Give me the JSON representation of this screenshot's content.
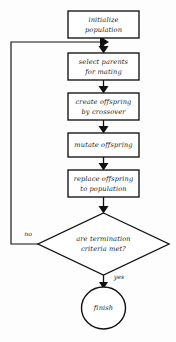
{
  "diagram": {
    "type": "flowchart",
    "nodes": [
      {
        "id": "initialize",
        "shape": "process",
        "label_line1": "initialize",
        "label_line2": "population"
      },
      {
        "id": "select",
        "shape": "process",
        "label_line1": "select parents",
        "label_line2": "for mating"
      },
      {
        "id": "crossover",
        "shape": "process",
        "label_line1": "create offspring",
        "label_line2": "by crossover"
      },
      {
        "id": "mutate",
        "shape": "process",
        "label_line1": "mutate offspring",
        "label_line2": ""
      },
      {
        "id": "replace",
        "shape": "process",
        "label_line1": "replace offspring",
        "label_line2": "to population"
      },
      {
        "id": "termination",
        "shape": "decision",
        "label_line1": "are termination",
        "label_line2": "criteria met?"
      },
      {
        "id": "finish",
        "shape": "terminal",
        "label_line1": "finish",
        "label_line2": ""
      }
    ],
    "edge_labels": {
      "no": "no",
      "yes": "yes"
    },
    "colors": {
      "stroke": "#111111",
      "fill": "#ffffff",
      "background": "#fdfdfd",
      "text": "#1a1a1a"
    }
  }
}
